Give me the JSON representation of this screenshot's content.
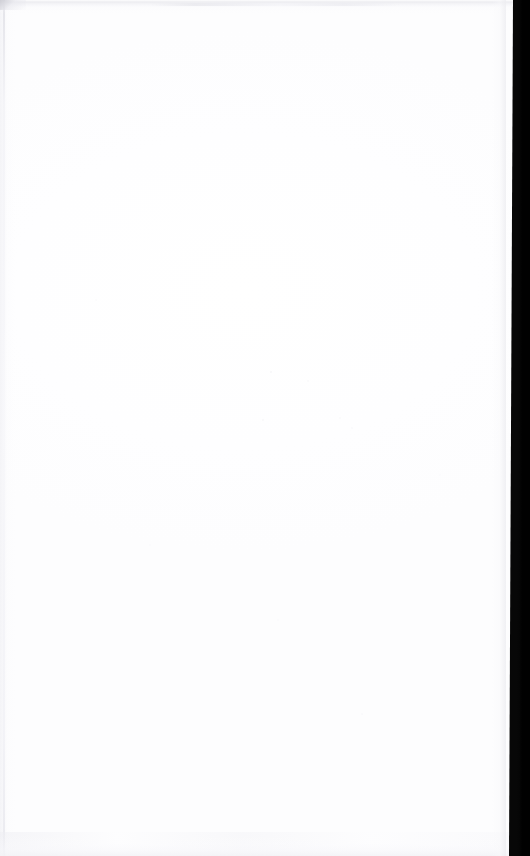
{
  "page": {
    "kind": "scanned-blank-page",
    "width": 530,
    "height": 856,
    "visible_text": "",
    "description_label": "Blank scanned page"
  },
  "colors": {
    "paper": "#ffffff",
    "paper_tint": "#fdfdfe",
    "scanner_edge": "#070707",
    "edge_line_gray": "#e1e1e7",
    "streak_gray": "#ececf0",
    "corner_smudge_gray": "#cdcdd4"
  },
  "artifacts": {
    "scanner_edge": {
      "name": "right-scanner-edge",
      "side": "right",
      "top_start_x": 513,
      "bottom_start_x": 509,
      "color": "#070707"
    },
    "top_streak": {
      "name": "top-edge-streak",
      "y": 2,
      "height": 4,
      "color": "#ececf0"
    },
    "bottom_mottle": {
      "name": "bottom-edge-mottle",
      "y": 838,
      "height": 18,
      "color": "#f3f3f6"
    },
    "left_rule": {
      "name": "left-edge-rule",
      "x": 3,
      "width": 2,
      "color": "#e1e1e7"
    },
    "corner_smudge": {
      "name": "top-left-corner-smudge",
      "x": 0,
      "y": 0,
      "color": "#cdcdd4"
    },
    "dust_specks": {
      "name": "scan-dust-specks",
      "count": 10,
      "color": "#e6e6ec"
    }
  }
}
